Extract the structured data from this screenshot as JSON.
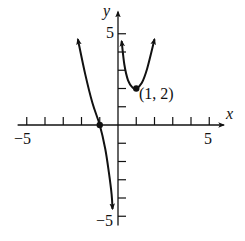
{
  "chart_data": {
    "type": "line",
    "title": "",
    "xlabel": "x",
    "ylabel": "y",
    "xlim": [
      -5.5,
      5.8
    ],
    "ylim": [
      -5.5,
      6.2
    ],
    "xticks": [
      -5,
      -4,
      -3,
      -2,
      -1,
      1,
      2,
      3,
      4,
      5
    ],
    "yticks": [
      -5,
      -4,
      -3,
      -2,
      -1,
      1,
      2,
      3,
      4,
      5
    ],
    "xtick_labels": [
      "-5",
      "5"
    ],
    "ytick_labels": [
      "5",
      "-5"
    ],
    "grid": false,
    "series": [
      {
        "name": "left-branch",
        "points": [
          [
            -2.2,
            4.7
          ],
          [
            -1.8,
            2.8
          ],
          [
            -1.4,
            1.2
          ],
          [
            -1.0,
            0.0
          ],
          [
            -0.7,
            -1.3
          ],
          [
            -0.5,
            -2.6
          ],
          [
            -0.35,
            -3.8
          ],
          [
            -0.3,
            -4.6
          ]
        ],
        "arrow_start": true,
        "arrow_end": true
      },
      {
        "name": "right-branch",
        "points": [
          [
            0.2,
            4.6
          ],
          [
            0.35,
            3.3
          ],
          [
            0.55,
            2.45
          ],
          [
            0.8,
            2.05
          ],
          [
            1.0,
            2.0
          ],
          [
            1.3,
            2.3
          ],
          [
            1.6,
            3.1
          ],
          [
            2.0,
            4.7
          ]
        ],
        "arrow_start": true,
        "arrow_end": true
      }
    ],
    "marked_points": [
      {
        "x": -1,
        "y": 0,
        "label": ""
      },
      {
        "x": 1,
        "y": 2,
        "label": "(1, 2)"
      }
    ],
    "annotations": [
      "(1, 2)"
    ]
  },
  "labels": {
    "x_axis": "x",
    "y_axis": "y",
    "x_min": "−5",
    "x_max": "5",
    "y_max": "5",
    "y_min": "−5",
    "point": "(1, 2)"
  }
}
